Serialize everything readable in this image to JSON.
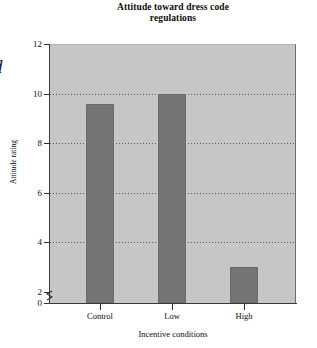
{
  "margin_glyph": "d",
  "chart_data": {
    "type": "bar",
    "title": "Attitude toward dress code regulations",
    "title_lines": [
      "Attitude toward dress code",
      "regulations"
    ],
    "xlabel": "Incentive conditions",
    "ylabel": "Attitude rating",
    "categories": [
      "Control",
      "Low",
      "High"
    ],
    "values": [
      9.6,
      10.0,
      3.0
    ],
    "ylim": [
      0,
      12
    ],
    "yticks": [
      0,
      2,
      4,
      6,
      8,
      10,
      12
    ],
    "ytick_labels": [
      "0",
      "2",
      "4",
      "6",
      "8",
      "10",
      "12"
    ],
    "gridlines": [
      4,
      6,
      8,
      10
    ],
    "grid": true,
    "grid_style": "dotted",
    "axis_break": true,
    "axis_break_between": [
      0,
      2
    ],
    "legend": null,
    "colors": {
      "bar": "#757575",
      "plot_background": "#c6c6c6",
      "axis": "#2e2e2e",
      "grid": "#5a5a5a",
      "text": "#0d0d0d",
      "figure_background": "#ffffff"
    }
  }
}
